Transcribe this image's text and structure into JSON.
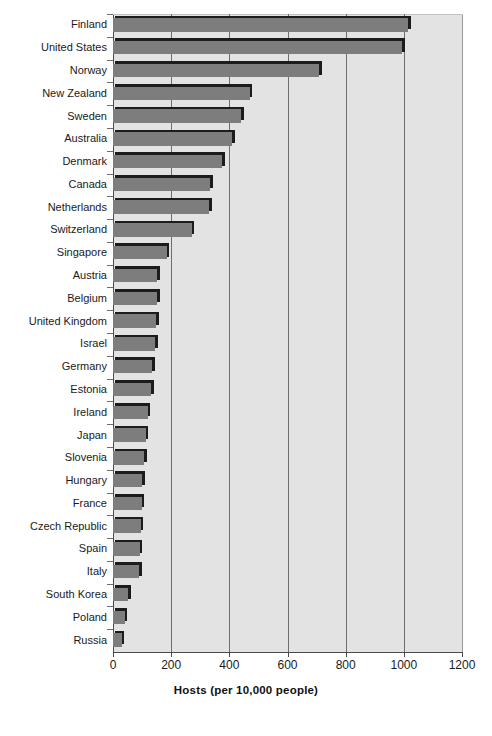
{
  "chart_data": {
    "type": "bar",
    "orientation": "horizontal",
    "title": "",
    "xlabel": "Hosts (per 10,000 people)",
    "ylabel": "",
    "xlim": [
      0,
      1200
    ],
    "xticks": [
      0,
      200,
      400,
      600,
      800,
      1000,
      1200
    ],
    "xtick_labels": [
      "0",
      "200",
      "400",
      "600",
      "800",
      "1000",
      "1200"
    ],
    "grid": true,
    "grid_axis": "x",
    "legend": null,
    "plot_background": "#e3e3e3",
    "bar_color": "#7d7d7d",
    "bar_edge_color": "#1c1c1c",
    "categories": [
      "Finland",
      "United States",
      "Norway",
      "New Zealand",
      "Sweden",
      "Australia",
      "Denmark",
      "Canada",
      "Netherlands",
      "Switzerland",
      "Singapore",
      "Austria",
      "Belgium",
      "United Kingdom",
      "Israel",
      "Germany",
      "Estonia",
      "Ireland",
      "Japan",
      "Slovenia",
      "Hungary",
      "France",
      "Czech Republic",
      "Spain",
      "Italy",
      "South Korea",
      "Poland",
      "Russia"
    ],
    "values": [
      1015,
      995,
      710,
      470,
      440,
      410,
      375,
      335,
      330,
      270,
      185,
      152,
      152,
      148,
      145,
      135,
      132,
      120,
      112,
      108,
      100,
      98,
      95,
      92,
      90,
      52,
      40,
      30
    ]
  }
}
